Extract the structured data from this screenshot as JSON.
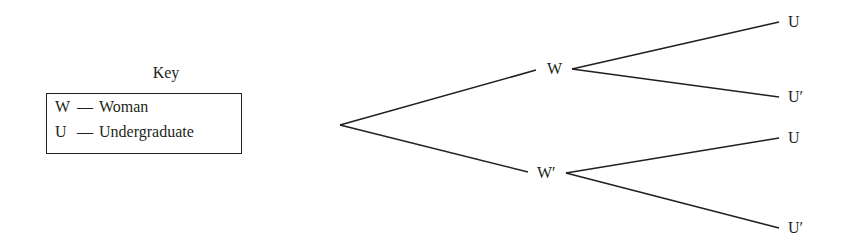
{
  "key": {
    "title": "Key",
    "entries": [
      {
        "symbol": "W",
        "dash": "—",
        "meaning": "Woman"
      },
      {
        "symbol": "U",
        "dash": "—",
        "meaning": "Undergraduate"
      }
    ]
  },
  "tree": {
    "level1": [
      {
        "label": "W"
      },
      {
        "label": "W′"
      }
    ],
    "level2": [
      {
        "label": "U"
      },
      {
        "label": "U′"
      },
      {
        "label": "U"
      },
      {
        "label": "U′"
      }
    ]
  },
  "colors": {
    "ink": "#231f20",
    "background": "#ffffff"
  }
}
